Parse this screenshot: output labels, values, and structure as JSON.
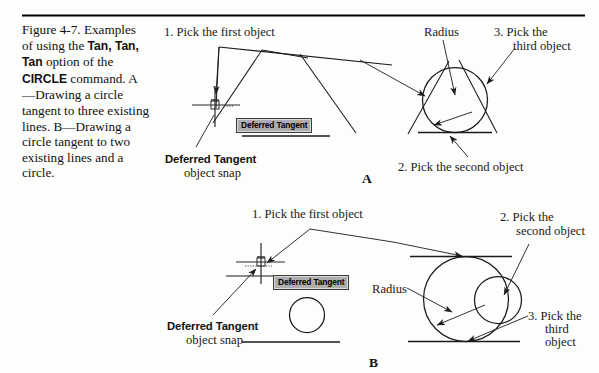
{
  "figure": {
    "number": "Figure 4-7.",
    "caption_parts": [
      {
        "text": "Figure 4-7.\nExamples of using\nthe ",
        "bold": false
      },
      {
        "text": "Tan, Tan, Tan",
        "bold": true
      },
      {
        "text": "\noption of the\n",
        "bold": false
      },
      {
        "text": "CIRCLE",
        "bold": true
      },
      {
        "text": " command.\nA—Drawing a\ncircle tangent to\nthree existing lines.\nB—Drawing a circle\ntangent to two\nexisting lines and a\ncircle.",
        "bold": false
      }
    ],
    "caption_plain": "Figure 4-7. Examples of using the Tan, Tan, Tan option of the CIRCLE command. A—Drawing a circle tangent to three existing lines. B—Drawing a circle tangent to two existing lines and a circle."
  },
  "panel_a": {
    "letter": "A",
    "labels": {
      "pick_first": "1. Pick the first object",
      "pick_second": "2. Pick the second object",
      "pick_third_line1": "3. Pick the",
      "pick_third_line2": "third object",
      "radius": "Radius",
      "snap_bold": "Deferred Tangent",
      "snap_sub": "object snap"
    },
    "tooltip": "Deferred Tangent"
  },
  "panel_b": {
    "letter": "B",
    "labels": {
      "pick_first": "1. Pick the first object",
      "pick_second_line1": "2. Pick the",
      "pick_second_line2": "second object",
      "pick_third_line1": "3. Pick the",
      "pick_third_line2": "third",
      "pick_third_line3": "object",
      "radius": "Radius",
      "snap_bold": "Deferred Tangent",
      "snap_sub": "object snap"
    },
    "tooltip": "Deferred Tangent"
  },
  "colors": {
    "ink": "#1a1a1a",
    "rule": "#000000",
    "tooltip_bg": "#adadad",
    "tooltip_border": "#3b3b3b",
    "page_bg": "#fdfdfc"
  }
}
